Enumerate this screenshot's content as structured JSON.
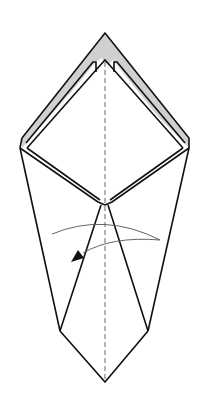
{
  "diagram": {
    "type": "origami-fold-step",
    "colors": {
      "background": "#ffffff",
      "outline": "#111111",
      "colored_side": "#d0d0d0",
      "crease_line": "#555555",
      "arrow": "#111111"
    },
    "elements": {
      "outline": "paper outline (kite / tie shape)",
      "colored_layer": "grey reverse-side layer at top",
      "center_crease": "vertical dashed valley-fold line",
      "fold_arrow": "curved arrow pointing left (fold right flap over to the left)"
    }
  }
}
